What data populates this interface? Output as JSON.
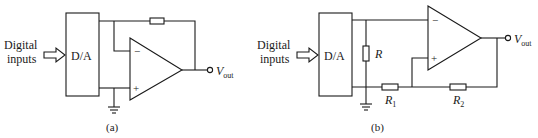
{
  "figure": {
    "panels": [
      {
        "id": "a",
        "caption": "(a)",
        "input_label_line1": "Digital",
        "input_label_line2": "inputs",
        "converter_label": "D/A",
        "opamp_minus": "−",
        "opamp_plus": "+",
        "output_label_main": "V",
        "output_label_sub": "out",
        "components": [
          "D/A converter",
          "op-amp",
          "feedback resistor",
          "ground"
        ]
      },
      {
        "id": "b",
        "caption": "(b)",
        "input_label_line1": "Digital",
        "input_label_line2": "inputs",
        "converter_label": "D/A",
        "opamp_minus": "−",
        "opamp_plus": "+",
        "output_label_main": "V",
        "output_label_sub": "out",
        "resistor_r": "R",
        "resistor_r1_main": "R",
        "resistor_r1_sub": "1",
        "resistor_r2_main": "R",
        "resistor_r2_sub": "2",
        "components": [
          "D/A converter",
          "op-amp",
          "R",
          "R1",
          "R2",
          "ground"
        ]
      }
    ],
    "colors": {
      "ink": "#1a1a1a",
      "background": "#ffffff"
    }
  }
}
